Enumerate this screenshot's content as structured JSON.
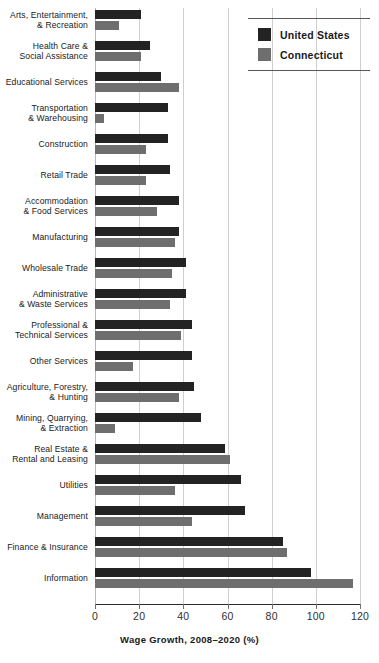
{
  "chart_data": {
    "type": "bar",
    "orientation": "horizontal",
    "title": "",
    "xlabel": "Wage Growth, 2008–2020 (%)",
    "ylabel": "",
    "xlim": [
      0,
      120
    ],
    "xticks": [
      0,
      20,
      40,
      60,
      80,
      100,
      120
    ],
    "xtick_labels": [
      "0",
      "20",
      "40",
      "60",
      "80",
      "100",
      "120"
    ],
    "grid": "vertical",
    "legend_position": "top-right",
    "categories": [
      "Arts, Entertainment, & Recreation",
      "Health Care & Social Assistance",
      "Educational Services",
      "Transportation & Warehousing",
      "Construction",
      "Retail Trade",
      "Accommodation & Food Services",
      "Manufacturing",
      "Wholesale Trade",
      "Administrative & Waste Services",
      "Professional & Technical Services",
      "Other Services",
      "Agriculture, Forestry, & Hunting",
      "Mining, Quarrying, & Extraction",
      "Real Estate & Rental and Leasing",
      "Utilities",
      "Management",
      "Finance & Insurance",
      "Information"
    ],
    "category_lines": [
      [
        "Arts, Entertainment,",
        "& Recreation"
      ],
      [
        "Health Care &",
        "Social Assistance"
      ],
      [
        "Educational Services"
      ],
      [
        "Transportation",
        "& Warehousing"
      ],
      [
        "Construction"
      ],
      [
        "Retail Trade"
      ],
      [
        "Accommodation",
        "& Food Services"
      ],
      [
        "Manufacturing"
      ],
      [
        "Wholesale Trade"
      ],
      [
        "Administrative",
        "& Waste Services"
      ],
      [
        "Professional &",
        "Technical Services"
      ],
      [
        "Other Services"
      ],
      [
        "Agriculture, Forestry,",
        "& Hunting"
      ],
      [
        "Mining, Quarrying,",
        "& Extraction"
      ],
      [
        "Real Estate &",
        "Rental and Leasing"
      ],
      [
        "Utilities"
      ],
      [
        "Management"
      ],
      [
        "Finance & Insurance"
      ],
      [
        "Information"
      ]
    ],
    "series": [
      {
        "name": "United States",
        "color": "#232323",
        "values": [
          21,
          25,
          30,
          33,
          33,
          34,
          38,
          38,
          41,
          41,
          44,
          44,
          45,
          48,
          59,
          66,
          68,
          85,
          98
        ]
      },
      {
        "name": "Connecticut",
        "color": "#6e6e6e",
        "values": [
          11,
          21,
          38,
          4,
          23,
          23,
          28,
          36,
          35,
          34,
          39,
          17,
          38,
          9,
          61,
          36,
          44,
          87,
          117
        ]
      }
    ]
  },
  "legend": {
    "entries": [
      {
        "label": "United States",
        "color": "#232323"
      },
      {
        "label": "Connecticut",
        "color": "#6e6e6e"
      }
    ]
  },
  "axis": {
    "x_title": "Wage Growth, 2008–2020 (%)",
    "ticks": [
      "0",
      "20",
      "40",
      "60",
      "80",
      "100",
      "120"
    ]
  }
}
